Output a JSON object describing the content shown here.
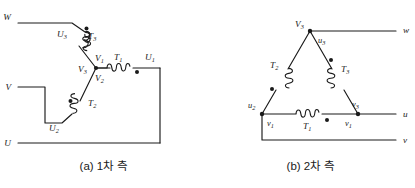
{
  "figure": {
    "captions": {
      "a": "(a) 1차 측",
      "b": "(b) 2차 측"
    },
    "stroke_color": "#1a1a1a",
    "background_color": "#ffffff"
  },
  "primary_side": {
    "connection": "Y (star)",
    "line_terminals": [
      {
        "name": "terminal-W",
        "label": "W"
      },
      {
        "name": "terminal-V",
        "label": "V"
      },
      {
        "name": "terminal-U",
        "label": "U"
      }
    ],
    "windings": [
      {
        "name": "winding-T1",
        "label": "T",
        "sub": "1"
      },
      {
        "name": "winding-T2",
        "label": "T",
        "sub": "2"
      },
      {
        "name": "winding-T3",
        "label": "T",
        "sub": "3"
      }
    ],
    "winding_ends": [
      {
        "name": "end-U1",
        "label": "U",
        "sub": "1"
      },
      {
        "name": "end-U2",
        "label": "U",
        "sub": "2"
      },
      {
        "name": "end-U3",
        "label": "U",
        "sub": "3"
      }
    ],
    "neutral_labels": [
      {
        "name": "neutral-V1",
        "label": "V",
        "sub": "1"
      },
      {
        "name": "neutral-V2",
        "label": "V",
        "sub": "2"
      },
      {
        "name": "neutral-V3",
        "label": "V",
        "sub": "3"
      }
    ]
  },
  "secondary_side": {
    "connection": "Delta",
    "line_terminals": [
      {
        "name": "terminal-w",
        "label": "w"
      },
      {
        "name": "terminal-u",
        "label": "u"
      },
      {
        "name": "terminal-v",
        "label": "v"
      }
    ],
    "windings": [
      {
        "name": "winding-T1",
        "label": "T",
        "sub": "1"
      },
      {
        "name": "winding-T2",
        "label": "T",
        "sub": "2"
      },
      {
        "name": "winding-T3",
        "label": "T",
        "sub": "3"
      }
    ],
    "corner_labels": [
      {
        "name": "apex-V3",
        "label": "V",
        "sub": "3"
      },
      {
        "name": "apex-u3",
        "label": "u",
        "sub": "3"
      },
      {
        "name": "left-u2",
        "label": "u",
        "sub": "2"
      },
      {
        "name": "left-v1",
        "label": "v",
        "sub": "1"
      },
      {
        "name": "right-v3",
        "label": "v",
        "sub": "3"
      },
      {
        "name": "right-v1",
        "label": "v",
        "sub": "1"
      }
    ]
  }
}
